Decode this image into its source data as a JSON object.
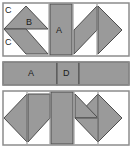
{
  "figure": {
    "width": 132,
    "height": 148,
    "colors": {
      "fill": "#9a9a9a",
      "stroke": "#4d4d4d",
      "outline": "#8c8c8c",
      "background": "#ffffff",
      "label_text": "#1a1a1a"
    },
    "panels": [
      {
        "name": "top-panel",
        "label": "Top assembled rectangle",
        "piece_labels": [
          "C",
          "B",
          "C",
          "A"
        ]
      },
      {
        "name": "middle-panel",
        "label": "Middle rectangular strip",
        "piece_labels": [
          "A",
          "D"
        ]
      },
      {
        "name": "bottom-panel",
        "label": "Bottom assembled rectangle",
        "piece_labels": []
      }
    ],
    "labels": {
      "c_top": "C",
      "b": "B",
      "c_bottom": "C",
      "a_top": "A",
      "a_middle": "A",
      "d_middle": "D"
    }
  }
}
